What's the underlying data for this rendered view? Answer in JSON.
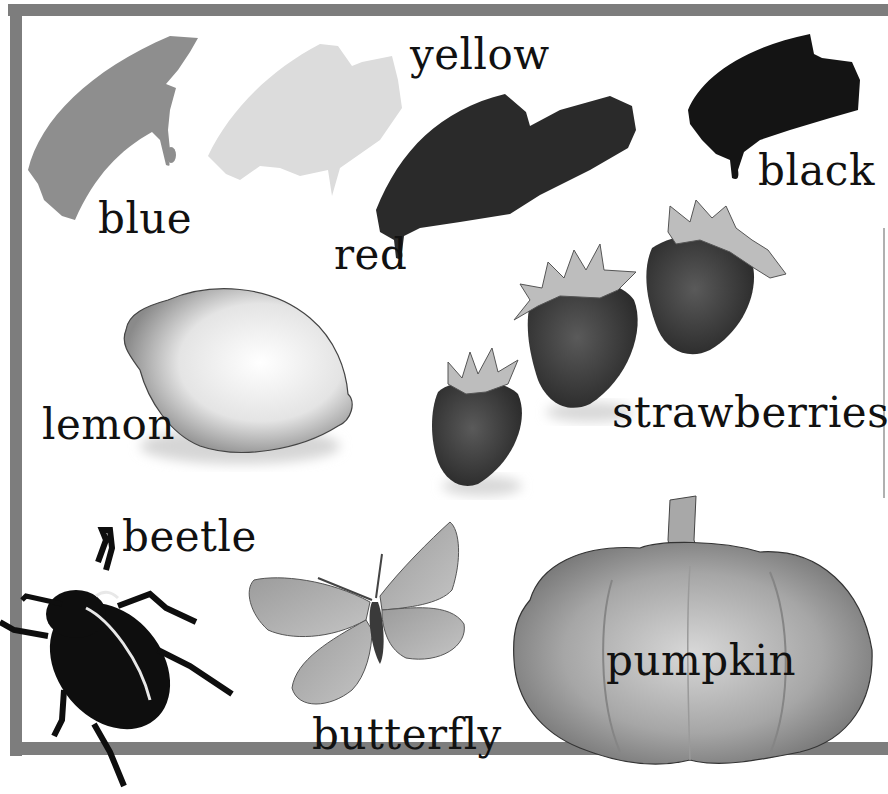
{
  "page": {
    "background": "#ffffff",
    "frame_color": "#7d7d7d"
  },
  "items": {
    "blue": {
      "label": "blue",
      "icon": "paint-stroke-icon",
      "tone": "#8e8e8e"
    },
    "yellow": {
      "label": "yellow",
      "icon": "paint-stroke-icon",
      "tone": "#dcdcdc"
    },
    "red": {
      "label": "red",
      "icon": "paint-stroke-icon",
      "tone": "#2a2a2a"
    },
    "black": {
      "label": "black",
      "icon": "paint-stroke-icon",
      "tone": "#141414"
    },
    "lemon": {
      "label": "lemon",
      "icon": "lemon-icon",
      "tone": "#e6e6e6"
    },
    "strawberries": {
      "label": "strawberries",
      "icon": "strawberry-icon",
      "tone": "#3a3a3a"
    },
    "beetle": {
      "label": "beetle",
      "icon": "beetle-icon",
      "tone": "#0e0e0e"
    },
    "butterfly": {
      "label": "butterfly",
      "icon": "butterfly-icon",
      "tone": "#a8a8a8"
    },
    "pumpkin": {
      "label": "pumpkin",
      "icon": "pumpkin-icon",
      "tone": "#9a9a9a"
    }
  }
}
